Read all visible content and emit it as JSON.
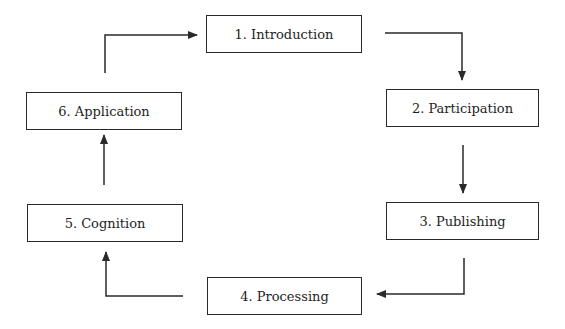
{
  "diagram": {
    "type": "cycle-flowchart",
    "steps": [
      {
        "id": 1,
        "label": "1. Introduction"
      },
      {
        "id": 2,
        "label": "2. Participation"
      },
      {
        "id": 3,
        "label": "3. Publishing"
      },
      {
        "id": 4,
        "label": "4. Processing"
      },
      {
        "id": 5,
        "label": "5. Cognition"
      },
      {
        "id": 6,
        "label": "6. Application"
      }
    ],
    "edges": [
      {
        "from": 1,
        "to": 2
      },
      {
        "from": 2,
        "to": 3
      },
      {
        "from": 3,
        "to": 4
      },
      {
        "from": 4,
        "to": 5
      },
      {
        "from": 5,
        "to": 6
      },
      {
        "from": 6,
        "to": 1
      }
    ],
    "colors": {
      "line": "#2a2a2a",
      "background": "#ffffff",
      "text": "#1e1e1e"
    }
  }
}
